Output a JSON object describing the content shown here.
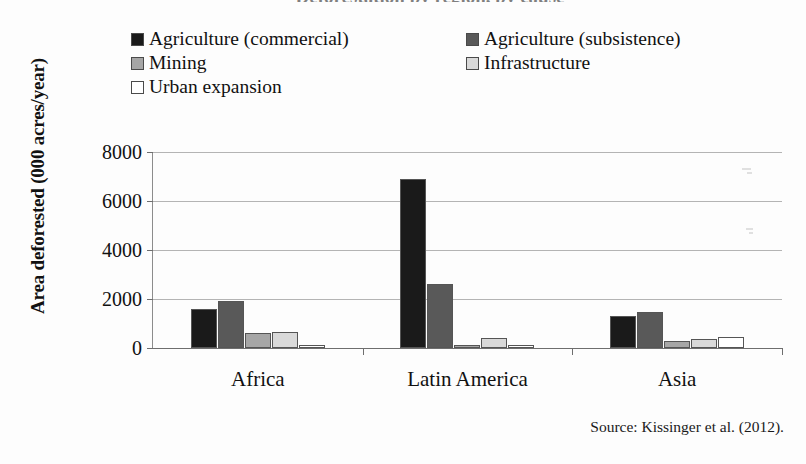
{
  "title": "Deforestation by region, by cause",
  "y_axis_title": "Area deforested (000 acres/year)",
  "source_note": "Source: Kissinger et al. (2012).",
  "legend": [
    {
      "label": "Agriculture (commercial)",
      "color": "#1a1a1a",
      "icon": "legend-swatch-icon"
    },
    {
      "label": "Agriculture (subsistence)",
      "color": "#595959",
      "icon": "legend-swatch-icon"
    },
    {
      "label": "Mining",
      "color": "#a6a6a6",
      "icon": "legend-swatch-icon"
    },
    {
      "label": "Infrastructure",
      "color": "#d9d9d9",
      "icon": "legend-swatch-icon"
    },
    {
      "label": "Urban expansion",
      "color": "#ffffff",
      "icon": "legend-swatch-icon"
    }
  ],
  "y_ticks": [
    "0",
    "2000",
    "4000",
    "6000",
    "8000"
  ],
  "chart_data": {
    "type": "bar",
    "title": "Deforestation by region, by cause",
    "xlabel": "",
    "ylabel": "Area deforested (000 acres/year)",
    "ylim": [
      0,
      8000
    ],
    "ytick_values": [
      0,
      2000,
      4000,
      6000,
      8000
    ],
    "grid": true,
    "legend_position": "top",
    "categories": [
      "Africa",
      "Latin America",
      "Asia"
    ],
    "series": [
      {
        "name": "Agriculture (commercial)",
        "color": "#1a1a1a",
        "values": [
          1600,
          6900,
          1300
        ]
      },
      {
        "name": "Agriculture (subsistence)",
        "color": "#595959",
        "values": [
          1900,
          2600,
          1480
        ]
      },
      {
        "name": "Mining",
        "color": "#a6a6a6",
        "values": [
          600,
          140,
          300
        ]
      },
      {
        "name": "Infrastructure",
        "color": "#d9d9d9",
        "values": [
          650,
          420,
          350
        ]
      },
      {
        "name": "Urban expansion",
        "color": "#ffffff",
        "values": [
          140,
          110,
          470
        ]
      }
    ]
  }
}
